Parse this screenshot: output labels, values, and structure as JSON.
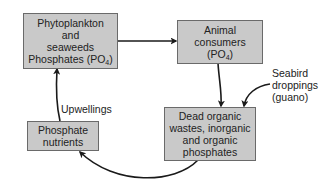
{
  "diagram": {
    "type": "cycle",
    "colors": {
      "box_fill": "#c9c9c9",
      "box_border": "#6a6a6a",
      "arrow": "#1a1a1a",
      "text": "#222222"
    },
    "nodes": [
      {
        "id": "producers",
        "lines": [
          "Phytoplankton",
          "and",
          "seaweeds"
        ],
        "last_line_prefix": "Phosphates (PO",
        "last_line_sub": "4",
        "last_line_suffix": ")"
      },
      {
        "id": "consumers",
        "lines": [
          "Animal",
          "consumers"
        ],
        "last_line_prefix": "(PO",
        "last_line_sub": "4",
        "last_line_suffix": ")"
      },
      {
        "id": "dead",
        "lines": [
          "Dead organic",
          "wastes, inorganic",
          "and organic",
          "phosphates"
        ]
      },
      {
        "id": "nutrients",
        "lines": [
          "Phosphate",
          "nutrients"
        ]
      }
    ],
    "labels": {
      "upwellings": "Upwellings",
      "guano": [
        "Seabird",
        "droppings",
        "(guano)"
      ]
    },
    "edges": [
      {
        "from": "producers",
        "to": "consumers"
      },
      {
        "from": "consumers",
        "to": "dead"
      },
      {
        "from": "guano",
        "to": "dead"
      },
      {
        "from": "dead",
        "to": "nutrients"
      },
      {
        "from": "nutrients",
        "to": "producers",
        "label": "Upwellings"
      }
    ]
  }
}
